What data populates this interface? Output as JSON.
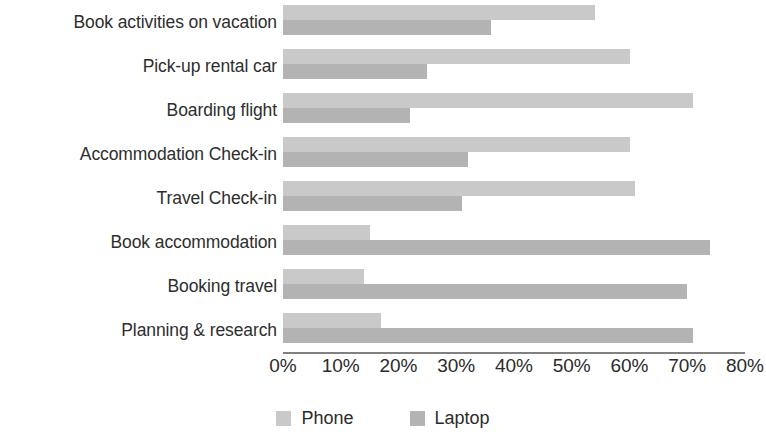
{
  "chart_data": {
    "type": "bar",
    "orientation": "horizontal",
    "title": "",
    "xlabel": "",
    "ylabel": "",
    "xlim": [
      0,
      80
    ],
    "xtick_labels": [
      "0%",
      "10%",
      "20%",
      "30%",
      "40%",
      "50%",
      "60%",
      "70%",
      "80%"
    ],
    "xtick_values": [
      0,
      10,
      20,
      30,
      40,
      50,
      60,
      70,
      80
    ],
    "grid": false,
    "legend_position": "bottom",
    "categories": [
      "Book activities on vacation",
      "Pick-up rental car",
      "Boarding flight",
      "Accommodation Check-in",
      "Travel Check-in",
      "Book accommodation",
      "Booking travel",
      "Planning & research"
    ],
    "series": [
      {
        "name": "Phone",
        "color": "#c9c9c9",
        "values": [
          54,
          60,
          71,
          60,
          61,
          15,
          14,
          17
        ]
      },
      {
        "name": "Laptop",
        "color": "#b3b3b3",
        "values": [
          36,
          25,
          22,
          32,
          31,
          74,
          70,
          71
        ]
      }
    ]
  },
  "legend": {
    "items": [
      {
        "label": "Phone",
        "color": "#c9c9c9"
      },
      {
        "label": "Laptop",
        "color": "#b3b3b3"
      }
    ]
  }
}
